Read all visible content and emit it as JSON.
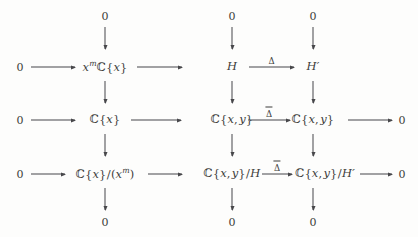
{
  "diagram": {
    "kind": "commutative-diagram",
    "columns": 3,
    "rows": 5,
    "nodes": {
      "top_zero_col1": "0",
      "top_zero_col2": "0",
      "top_zero_col3": "0",
      "r1_left_zero": "0",
      "r1_col1": "xᵐℂ{x}",
      "r1_col2": "H",
      "r1_col3": "H′",
      "r2_left_zero": "0",
      "r2_col1": "ℂ{x}",
      "r2_col2": "ℂ{x, y}",
      "r2_col3": "ℂ{x, y}",
      "r2_right_zero": "0",
      "r3_left_zero": "0",
      "r3_col1": "ℂ{x}/(xᵐ)",
      "r3_col2": "ℂ{x, y}/H",
      "r3_col3": "ℂ{x, y}/H′",
      "r3_right_zero": "0",
      "bottom_zero_col1": "0",
      "bottom_zero_col2": "0",
      "bottom_zero_col3": "0"
    },
    "arrow_labels": {
      "row1_delta": "Δ",
      "row2_delta_bar": "Δ",
      "row3_delta_bar": "Δ"
    },
    "colors": {
      "background": "#fdfdfc",
      "text": "#3c3c3a",
      "arrow": "#47474a"
    }
  }
}
